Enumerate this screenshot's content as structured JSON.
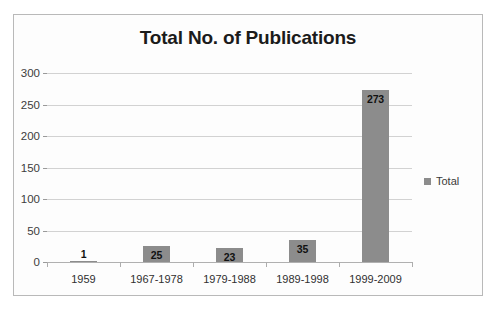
{
  "scan_artifact_text": "",
  "chart_data": {
    "type": "bar",
    "title": "Total No. of Publications",
    "xlabel": "",
    "ylabel": "",
    "categories": [
      "1959",
      "1967-1978",
      "1979-1988",
      "1989-1998",
      "1999-2009"
    ],
    "values": [
      1,
      25,
      23,
      35,
      273
    ],
    "series": [
      {
        "name": "Total",
        "values": [
          1,
          25,
          23,
          35,
          273
        ]
      }
    ],
    "ylim": [
      0,
      300
    ],
    "yticks": [
      0,
      50,
      100,
      150,
      200,
      250,
      300
    ],
    "ytick_labels": [
      "0",
      "50",
      "100",
      "150",
      "200",
      "250",
      "300"
    ],
    "data_labels": [
      "1",
      "25",
      "23",
      "35",
      "273"
    ],
    "grid": true,
    "legend": {
      "position": "right",
      "entries": [
        "Total"
      ]
    },
    "bar_color": "#8c8c8c",
    "grid_color": "#d2d2d2",
    "title_color": "#1b1b1b",
    "plot_background": "#fdfdfd",
    "frame_color": "#b9b9b9"
  },
  "legend": {
    "label": "Total"
  }
}
